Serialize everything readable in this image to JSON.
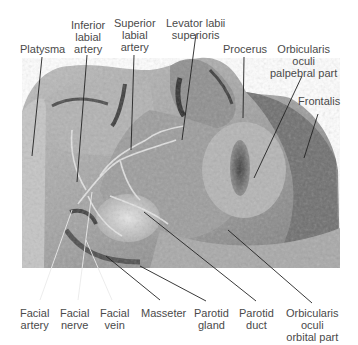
{
  "figure": {
    "type": "anatomical dissection photograph",
    "photo_palette": {
      "background": "#ffffff",
      "tissue_light": "#cfcfcf",
      "tissue_mid": "#9a9a9a",
      "tissue_dark": "#5e5e5e",
      "label_text": "#4a4a4a",
      "leader_dark": "#222222",
      "leader_light": "#ffffff"
    }
  },
  "labels": {
    "top": [
      {
        "id": "platysma",
        "lines": [
          "Platysma"
        ]
      },
      {
        "id": "inferior-labial-artery",
        "lines": [
          "Inferior",
          "labial",
          "artery"
        ]
      },
      {
        "id": "superior-labial-artery",
        "lines": [
          "Superior",
          "labial",
          "artery"
        ]
      },
      {
        "id": "levator-labii-superioris",
        "lines": [
          "Levator labii",
          "superioris"
        ]
      },
      {
        "id": "procerus",
        "lines": [
          "Procerus"
        ]
      },
      {
        "id": "orbicularis-oculi-palpebral",
        "lines": [
          "Orbicularis",
          "oculi",
          "palpebral part"
        ]
      },
      {
        "id": "frontalis",
        "lines": [
          "Frontalis"
        ]
      }
    ],
    "bottom": [
      {
        "id": "facial-artery",
        "lines": [
          "Facial",
          "artery"
        ]
      },
      {
        "id": "facial-nerve",
        "lines": [
          "Facial",
          "nerve"
        ]
      },
      {
        "id": "facial-vein",
        "lines": [
          "Facial",
          "vein"
        ]
      },
      {
        "id": "masseter",
        "lines": [
          "Masseter"
        ]
      },
      {
        "id": "parotid-gland",
        "lines": [
          "Parotid",
          "gland"
        ]
      },
      {
        "id": "parotid-duct",
        "lines": [
          "Parotid",
          "duct"
        ]
      },
      {
        "id": "orbicularis-oculi-orbital",
        "lines": [
          "Orbicularis",
          "oculi",
          "orbital part"
        ]
      }
    ]
  }
}
